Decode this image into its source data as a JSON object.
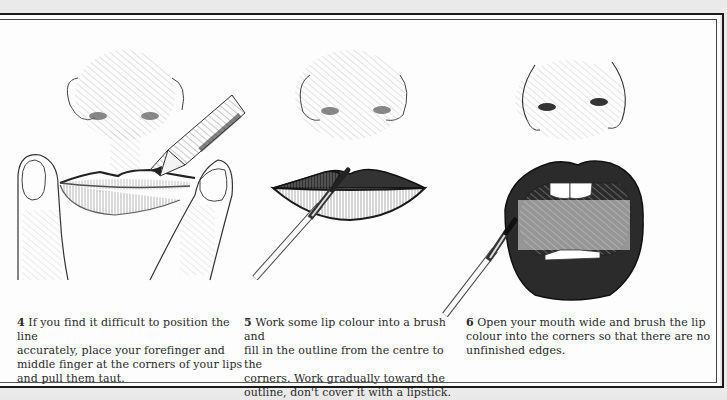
{
  "steps": [
    {
      "number": "4",
      "text": "If you find it difficult to position the line accurately, place your forefinger and middle finger at the corners of your lips and pull them taut.",
      "lines": [
        "If you find it difficult to position the line",
        "accurately, place your forefinger and",
        "middle finger at the corners of your lips",
        "and pull them taut."
      ],
      "illustration": "lips-with-fingers-and-pencil"
    },
    {
      "number": "5",
      "text": "Work some lip colour into a brush and fill in the outline from the centre to the corners. Work gradually toward the outline, don't cover it with a lipstick.",
      "lines": [
        "Work some lip colour into a brush and",
        "fill in the outline from the centre to the",
        "corners. Work gradually toward the",
        "outline, don't cover it with a lipstick."
      ],
      "illustration": "closed-lips-with-brush"
    },
    {
      "number": "6",
      "text": "Open your mouth wide and brush the lip colour into the corners so that there are no unfinished edges.",
      "lines": [
        "Open your mouth wide and brush the lip",
        "colour into the corners so that there are no",
        "unfinished edges."
      ],
      "illustration": "open-mouth-with-brush"
    }
  ]
}
